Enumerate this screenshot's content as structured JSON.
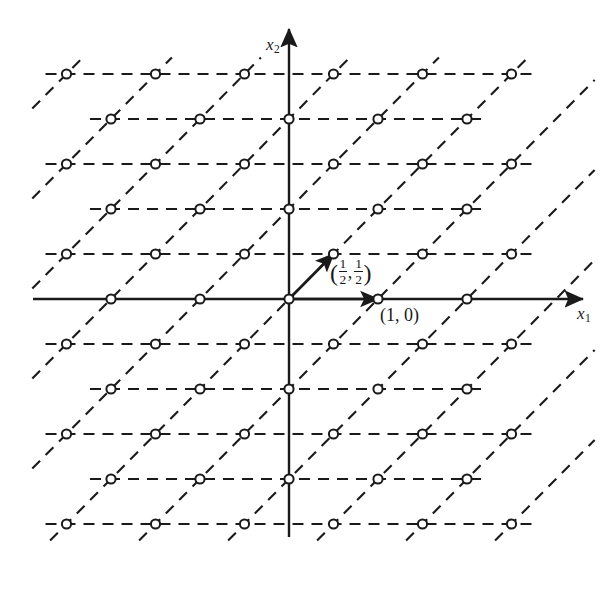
{
  "figure": {
    "width": 611,
    "height": 592,
    "background_color": "#ffffff",
    "ink_color": "#1a1a1a"
  },
  "axes": {
    "x_axis": {
      "label_base": "x",
      "label_sub": "1",
      "orientation": "horizontal",
      "arrow": "right"
    },
    "y_axis": {
      "label_base": "x",
      "label_sub": "2",
      "orientation": "vertical",
      "arrow": "up"
    }
  },
  "vectors": [
    {
      "name": "basis-vector-diagonal",
      "label_open_paren": "(",
      "label_num1": "1",
      "label_den1": "2",
      "label_comma": ",",
      "label_num2": "1",
      "label_den2": "2",
      "label_close_paren": ")",
      "plain_text": "(1/2, 1/2)",
      "from": [
        0,
        0
      ],
      "to": [
        0.5,
        0.5
      ]
    },
    {
      "name": "basis-vector-horizontal",
      "label": "(1, 0)",
      "from": [
        0,
        0
      ],
      "to": [
        1,
        0
      ]
    }
  ],
  "chart_data": {
    "type": "scatter",
    "xlabel": "x1",
    "ylabel": "x2",
    "grid": true,
    "legend": false,
    "basis": [
      [
        1,
        0
      ],
      [
        0.5,
        0.5
      ]
    ],
    "xlim": [
      -2.75,
      3.3
    ],
    "ylim": [
      -2.55,
      2.55
    ],
    "unit_px": {
      "x": 89,
      "y": 90
    },
    "origin_px": [
      289,
      299
    ],
    "row_spacing_units": 0.5,
    "rows": [
      {
        "y": 2.5,
        "x_offset": 0.5,
        "x_values": [
          -2.5,
          -1.5,
          -0.5,
          0.5,
          1.5,
          2.5
        ]
      },
      {
        "y": 2.0,
        "x_offset": 0.0,
        "x_values": [
          -2,
          -1,
          0,
          1,
          2
        ]
      },
      {
        "y": 1.5,
        "x_offset": 0.5,
        "x_values": [
          -2.5,
          -1.5,
          -0.5,
          0.5,
          1.5,
          2.5
        ]
      },
      {
        "y": 1.0,
        "x_offset": 0.0,
        "x_values": [
          -2,
          -1,
          0,
          1,
          2
        ]
      },
      {
        "y": 0.5,
        "x_offset": 0.5,
        "x_values": [
          -2.5,
          -1.5,
          -0.5,
          0.5,
          1.5,
          2.5
        ]
      },
      {
        "y": 0.0,
        "x_offset": 0.0,
        "x_values": [
          -2,
          -1,
          0,
          1,
          2
        ]
      },
      {
        "y": -0.5,
        "x_offset": 0.5,
        "x_values": [
          -2.5,
          -1.5,
          -0.5,
          0.5,
          1.5,
          2.5
        ]
      },
      {
        "y": -1.0,
        "x_offset": 0.0,
        "x_values": [
          -2,
          -1,
          0,
          1,
          2
        ]
      },
      {
        "y": -1.5,
        "x_offset": 0.5,
        "x_values": [
          -2.5,
          -1.5,
          -0.5,
          0.5,
          1.5,
          2.5
        ]
      },
      {
        "y": -2.0,
        "x_offset": 0.0,
        "x_values": [
          -2,
          -1,
          0,
          1,
          2
        ]
      },
      {
        "y": -2.5,
        "x_offset": 0.5,
        "x_values": [
          -2.5,
          -1.5,
          -0.5,
          0.5,
          1.5,
          2.5
        ]
      }
    ],
    "marker": {
      "shape": "circle",
      "fill": "#ffffff",
      "stroke": "#1a1a1a",
      "radius_px": 4.6
    },
    "lattice_lines": {
      "horizontal": {
        "style": "dashed",
        "dash": "11,8"
      },
      "diagonal": {
        "style": "dashed",
        "dash": "11,8",
        "slope_units": [
          0.5,
          0.5
        ]
      }
    }
  }
}
